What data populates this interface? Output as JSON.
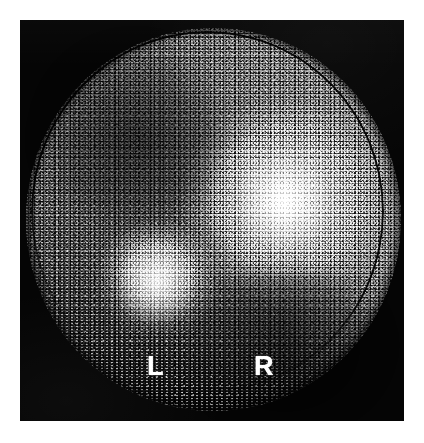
{
  "image": {
    "kind": "nuclear-medicine-scintigraphy-scan",
    "modality": "planar gamma camera scintigram",
    "colormap": "grayscale",
    "plate_background_color": "#050505",
    "page_background_color": "#ffffff",
    "field_of_view_shape": "circle"
  },
  "orientation_markers": {
    "left_label": "L",
    "right_label": "R",
    "marker_color": "#ffffff"
  },
  "features": {
    "hot_rim_label": "peripheral high-count rim",
    "arc_label": "collimator edge arc",
    "hotspot_right_label": "focal uptake (right)",
    "hotspot_left_label": "focal uptake (left)",
    "cold_zone_label": "photopenic region"
  }
}
